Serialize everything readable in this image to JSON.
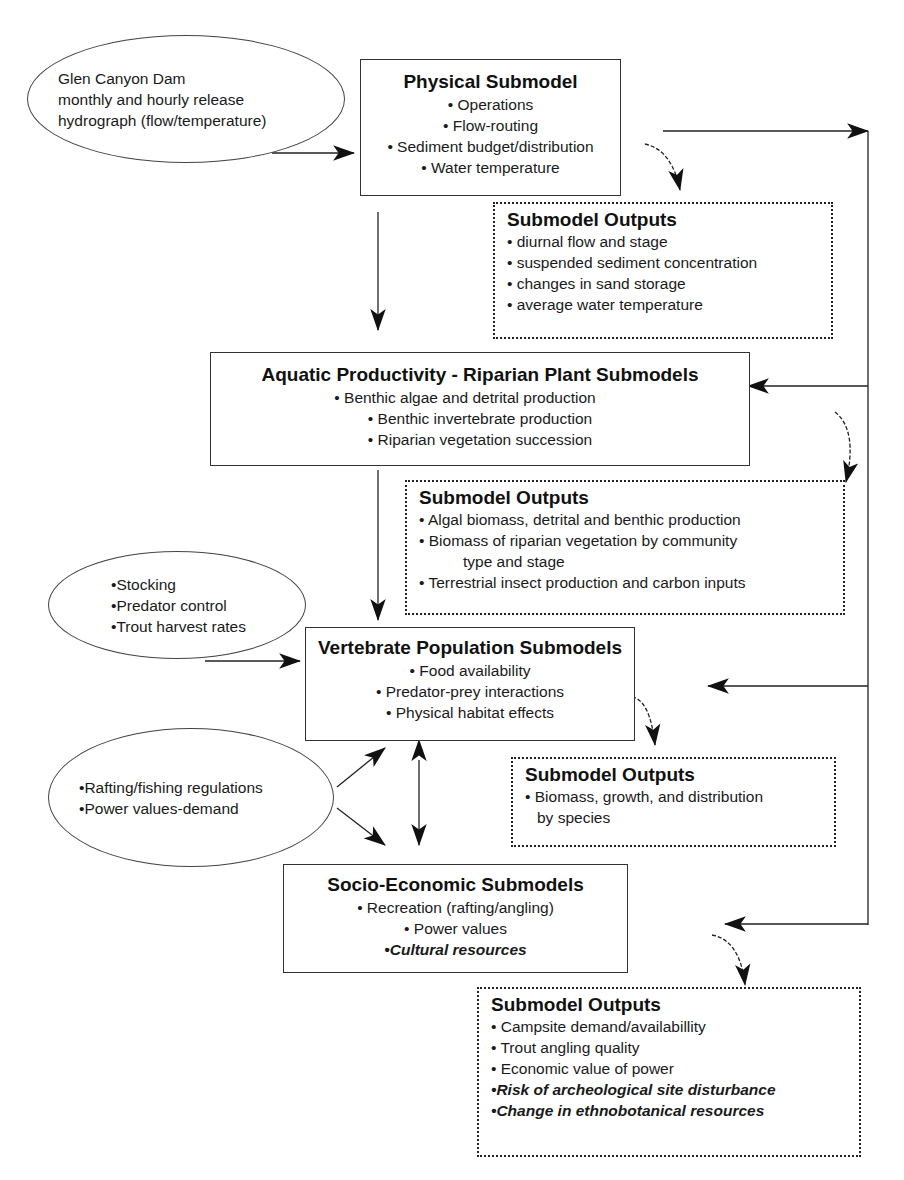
{
  "input_nodes": {
    "dam_release": {
      "lines": [
        "Glen Canyon Dam",
        "monthly and hourly release",
        "hydrograph (flow/temperature)"
      ]
    },
    "management": {
      "lines": [
        "•Stocking",
        "•Predator control",
        "•Trout harvest rates"
      ]
    },
    "regulations": {
      "lines": [
        "•Rafting/fishing regulations",
        "•Power values-demand"
      ]
    }
  },
  "submodels": {
    "physical": {
      "title": "Physical Submodel",
      "items": [
        "• Operations",
        "• Flow-routing",
        "• Sediment budget/distribution",
        "• Water temperature"
      ]
    },
    "aquatic": {
      "title": "Aquatic Productivity - Riparian Plant Submodels",
      "items": [
        "• Benthic algae and detrital production",
        "• Benthic invertebrate production",
        "• Riparian vegetation succession"
      ]
    },
    "vertebrate": {
      "title": "Vertebrate Population Submodels",
      "items": [
        "• Food availability",
        "• Predator-prey interactions",
        "• Physical habitat effects"
      ]
    },
    "socio": {
      "title": "Socio-Economic Submodels",
      "items": [
        "• Recreation (rafting/angling)",
        "• Power values"
      ],
      "emphasized_items": [
        "•Cultural resources"
      ]
    }
  },
  "outputs": {
    "physical": {
      "title": "Submodel Outputs",
      "items": [
        "• diurnal flow and stage",
        "• suspended sediment concentration",
        "• changes in sand storage",
        "• average water temperature"
      ]
    },
    "aquatic": {
      "title": "Submodel Outputs",
      "items": [
        "• Algal biomass, detrital and benthic production",
        "• Biomass of riparian vegetation by community",
        "type and stage",
        "• Terrestrial insect production and carbon inputs"
      ]
    },
    "vertebrate": {
      "title": "Submodel Outputs",
      "items": [
        "• Biomass, growth, and distribution",
        "by species"
      ]
    },
    "socio": {
      "title": "Submodel Outputs",
      "items": [
        "• Campsite demand/availabillity",
        "• Trout angling quality",
        "• Economic value of power"
      ],
      "emphasized_items": [
        "•Risk of archeological site disturbance",
        "•Change in ethnobotanical resources"
      ]
    }
  },
  "colors": {
    "line": "#222222",
    "background": "#ffffff"
  }
}
